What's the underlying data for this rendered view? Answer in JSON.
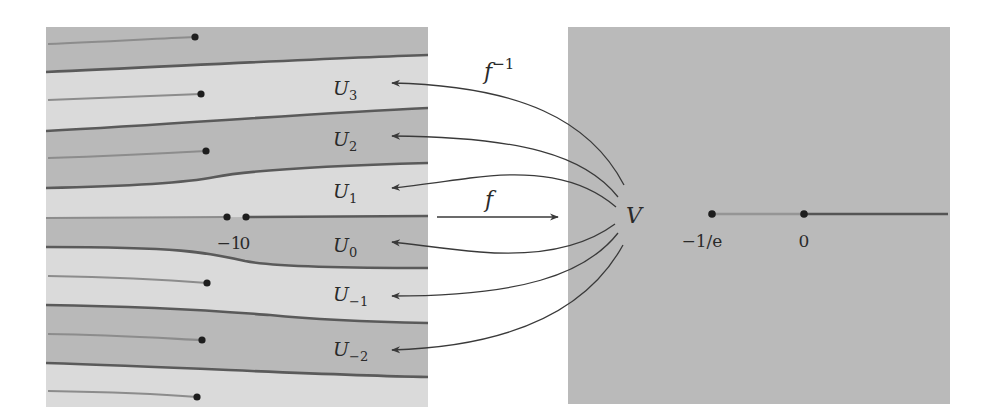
{
  "figure": {
    "colors": {
      "background": "#ffffff",
      "band_dark": "#b9b9b9",
      "band_light": "#dadada",
      "right_panel": "#bababa",
      "boundary_line": "#5a5a5a",
      "branch_cut": "#8c8c8c",
      "arrow": "#3a3a3a",
      "dot": "#1e1e1e"
    },
    "left_panel": {
      "regions": [
        {
          "name": "U",
          "sub": "3"
        },
        {
          "name": "U",
          "sub": "2"
        },
        {
          "name": "U",
          "sub": "1"
        },
        {
          "name": "U",
          "sub": "0"
        },
        {
          "name": "U",
          "sub": "−1"
        },
        {
          "name": "U",
          "sub": "−2"
        }
      ],
      "axis_labels": {
        "minus_one": "−1",
        "zero": "0"
      }
    },
    "right_panel": {
      "set_label": "V",
      "axis_labels": {
        "minus_one_over_e": "−1/e",
        "zero": "0"
      }
    },
    "maps": {
      "forward": {
        "base": "f",
        "sup": ""
      },
      "inverse": {
        "base": "f",
        "sup": "−1"
      }
    }
  }
}
